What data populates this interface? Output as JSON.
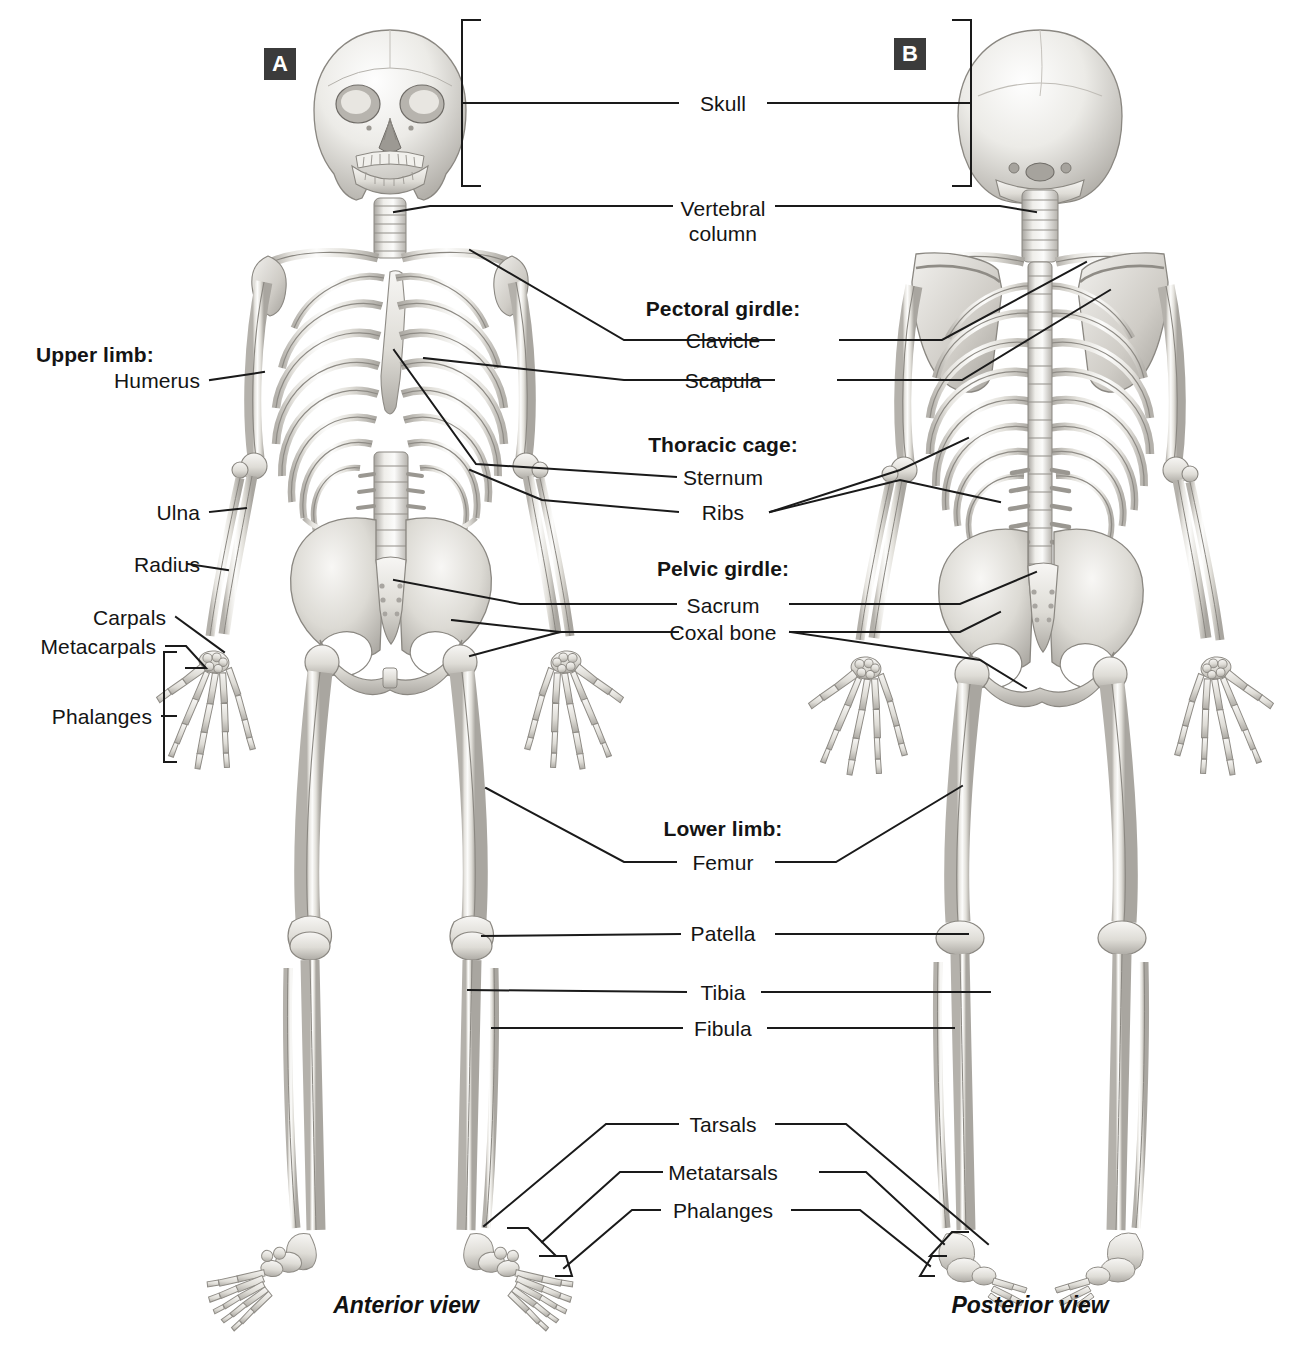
{
  "figure": {
    "panels": [
      {
        "tag": "A",
        "caption": "Anterior view"
      },
      {
        "tag": "B",
        "caption": "Posterior view"
      }
    ]
  },
  "labels": {
    "skull": "Skull",
    "vertebral_column_line1": "Vertebral",
    "vertebral_column_line2": "column",
    "pectoral_girdle": "Pectoral girdle:",
    "clavicle": "Clavicle",
    "scapula": "Scapula",
    "thoracic_cage": "Thoracic cage:",
    "sternum": "Sternum",
    "ribs": "Ribs",
    "pelvic_girdle": "Pelvic girdle:",
    "sacrum": "Sacrum",
    "coxal_bone": "Coxal bone",
    "lower_limb": "Lower limb:",
    "femur": "Femur",
    "patella": "Patella",
    "tibia": "Tibia",
    "fibula": "Fibula",
    "tarsals": "Tarsals",
    "metatarsals": "Metatarsals",
    "phalanges_foot": "Phalanges",
    "upper_limb": "Upper limb:",
    "humerus": "Humerus",
    "ulna": "Ulna",
    "radius": "Radius",
    "carpals": "Carpals",
    "metacarpals": "Metacarpals",
    "phalanges_hand": "Phalanges"
  },
  "colors": {
    "line": "#1a1a1a",
    "bone_light": "#fbfbfa",
    "bone_mid": "#dedcd7",
    "bone_shade": "#b9b6b0",
    "bone_dark": "#97948e",
    "panel_tag_bg": "#3b3b3b",
    "background": "#ffffff"
  }
}
